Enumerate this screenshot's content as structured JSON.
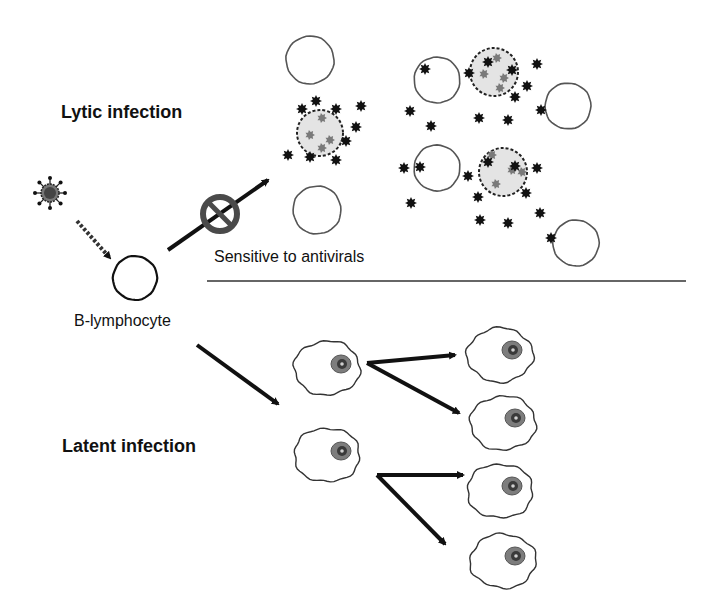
{
  "labels": {
    "lytic": "Lytic infection",
    "latent": "Latent infection",
    "b_cell": "B-lymphocyte",
    "sensitive": "Sensitive to antivirals"
  },
  "colors": {
    "ink": "#111111",
    "cell_outline": "#555555",
    "infected_fill": "#e4e4e4",
    "inclusion": "#7a7a7a",
    "prohibit": "#4a4a4a",
    "nucleus_outer": "#7d7d7d",
    "nucleus_inner": "#3a3a3a",
    "divider": "#333333"
  },
  "virus": {
    "x": 50,
    "y": 193,
    "r": 9
  },
  "b_lymphocyte": {
    "x": 135,
    "y": 278,
    "r": 22
  },
  "prohibit": {
    "x": 220,
    "y": 214,
    "r": 17
  },
  "divider": {
    "x1": 207,
    "y1": 281,
    "x2": 686,
    "y2": 281
  },
  "lytic_empty_cells": [
    {
      "x": 310,
      "y": 60,
      "r": 24
    },
    {
      "x": 317,
      "y": 210,
      "r": 24
    },
    {
      "x": 437,
      "y": 80,
      "r": 23
    },
    {
      "x": 568,
      "y": 106,
      "r": 23
    },
    {
      "x": 437,
      "y": 168,
      "r": 23
    },
    {
      "x": 576,
      "y": 243,
      "r": 23
    }
  ],
  "lytic_infected_cells": [
    {
      "x": 320,
      "y": 133,
      "r": 23
    },
    {
      "x": 494,
      "y": 72,
      "r": 24
    },
    {
      "x": 503,
      "y": 172,
      "r": 24
    }
  ],
  "inclusions": [
    [
      322,
      118
    ],
    [
      310,
      135
    ],
    [
      330,
      140
    ],
    [
      322,
      148
    ],
    [
      497,
      58
    ],
    [
      484,
      74
    ],
    [
      504,
      78
    ],
    [
      500,
      88
    ],
    [
      492,
      155
    ],
    [
      512,
      170
    ],
    [
      522,
      172
    ],
    [
      496,
      184
    ]
  ],
  "virions": [
    [
      316,
      101
    ],
    [
      302,
      109
    ],
    [
      336,
      109
    ],
    [
      361,
      106
    ],
    [
      356,
      127
    ],
    [
      346,
      141
    ],
    [
      288,
      155
    ],
    [
      310,
      157
    ],
    [
      336,
      160
    ],
    [
      425,
      69
    ],
    [
      410,
      111
    ],
    [
      431,
      126
    ],
    [
      469,
      73
    ],
    [
      488,
      62
    ],
    [
      512,
      70
    ],
    [
      537,
      64
    ],
    [
      527,
      86
    ],
    [
      515,
      97
    ],
    [
      479,
      118
    ],
    [
      508,
      120
    ],
    [
      541,
      110
    ],
    [
      404,
      168
    ],
    [
      420,
      167
    ],
    [
      411,
      203
    ],
    [
      468,
      176
    ],
    [
      488,
      162
    ],
    [
      515,
      166
    ],
    [
      537,
      168
    ],
    [
      526,
      193
    ],
    [
      478,
      197
    ],
    [
      480,
      220
    ],
    [
      508,
      223
    ],
    [
      540,
      213
    ],
    [
      551,
      238
    ]
  ],
  "latent_parents": [
    {
      "x": 327,
      "y": 368,
      "nx": 341,
      "ny": 364
    },
    {
      "x": 327,
      "y": 455,
      "nx": 341,
      "ny": 451
    }
  ],
  "latent_daughters": [
    {
      "x": 500,
      "y": 355,
      "nx": 512,
      "ny": 350
    },
    {
      "x": 503,
      "y": 423,
      "nx": 515,
      "ny": 418
    },
    {
      "x": 500,
      "y": 491,
      "nx": 512,
      "ny": 486
    },
    {
      "x": 503,
      "y": 561,
      "nx": 515,
      "ny": 556
    }
  ],
  "arrows": [
    {
      "id": "infect",
      "x1": 77,
      "y1": 221,
      "x2": 110,
      "y2": 258,
      "dashed": true
    },
    {
      "id": "to-lytic",
      "x1": 168,
      "y1": 250,
      "x2": 268,
      "y2": 180,
      "dashed": false
    },
    {
      "id": "to-latent",
      "x1": 197,
      "y1": 345,
      "x2": 278,
      "y2": 404,
      "dashed": false
    },
    {
      "id": "div1a",
      "x1": 367,
      "y1": 363,
      "x2": 455,
      "y2": 355,
      "dashed": false
    },
    {
      "id": "div1b",
      "x1": 367,
      "y1": 363,
      "x2": 459,
      "y2": 413,
      "dashed": false
    },
    {
      "id": "div2a",
      "x1": 377,
      "y1": 475,
      "x2": 463,
      "y2": 475,
      "dashed": false
    },
    {
      "id": "div2b",
      "x1": 377,
      "y1": 475,
      "x2": 445,
      "y2": 544,
      "dashed": false
    }
  ]
}
